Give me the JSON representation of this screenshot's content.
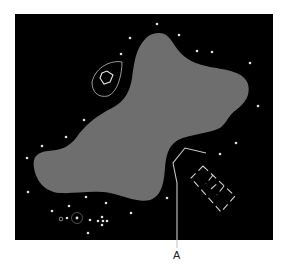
{
  "figure": {
    "background_color": "#000000",
    "blob_color": "#6e6e6e",
    "outline_color": "#c8c8c8",
    "star_color": "#e0e0e0",
    "frame": {
      "x": 15,
      "y": 14,
      "width": 258,
      "height": 226
    }
  },
  "labels": {
    "pointer_label": "A"
  },
  "stars": [
    [
      157,
      24
    ],
    [
      130,
      38
    ],
    [
      179,
      35
    ],
    [
      197,
      51
    ],
    [
      212,
      52
    ],
    [
      250,
      63
    ],
    [
      121,
      54
    ],
    [
      258,
      106
    ],
    [
      84,
      120
    ],
    [
      66,
      137
    ],
    [
      42,
      146
    ],
    [
      27,
      158
    ],
    [
      236,
      143
    ],
    [
      220,
      154
    ],
    [
      28,
      192
    ],
    [
      86,
      197
    ],
    [
      69,
      206
    ],
    [
      106,
      203
    ],
    [
      52,
      211
    ],
    [
      131,
      213
    ],
    [
      167,
      198
    ],
    [
      67,
      218
    ],
    [
      90,
      220
    ],
    [
      98,
      221
    ],
    [
      102,
      217
    ],
    [
      103,
      221
    ],
    [
      107,
      221
    ],
    [
      102,
      225
    ],
    [
      88,
      233
    ]
  ]
}
